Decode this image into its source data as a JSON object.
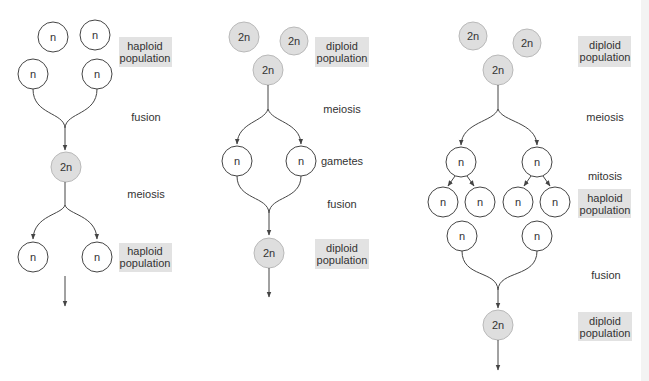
{
  "panels": [
    {
      "id": "haplontic",
      "labels": {
        "top_population": [
          "haploid",
          "population"
        ],
        "step1": "fusion",
        "step2": "meiosis",
        "bottom_population": [
          "haploid",
          "population"
        ]
      },
      "cells": {
        "top": [
          "n",
          "n",
          "n",
          "n"
        ],
        "zygote": "2n",
        "products": [
          "n",
          "n"
        ]
      }
    },
    {
      "id": "diplontic",
      "labels": {
        "top_population": [
          "diploid",
          "population"
        ],
        "step1": "meiosis",
        "step2": "gametes",
        "step3": "fusion",
        "bottom_population": [
          "diploid",
          "population"
        ]
      },
      "cells": {
        "top": [
          "2n",
          "2n",
          "2n"
        ],
        "gametes": [
          "n",
          "n"
        ],
        "zygote": "2n"
      }
    },
    {
      "id": "haplodiplontic",
      "labels": {
        "top_population": [
          "diploid",
          "population"
        ],
        "step1": "meiosis",
        "step2": "mitosis",
        "mid_population": [
          "haploid",
          "population"
        ],
        "step3": "fusion",
        "bottom_population": [
          "diploid",
          "population"
        ]
      },
      "cells": {
        "top": [
          "2n",
          "2n",
          "2n"
        ],
        "spores": [
          "n",
          "n"
        ],
        "mitotic_products": [
          "n",
          "n",
          "n",
          "n"
        ],
        "gametes": [
          "n",
          "n"
        ],
        "zygote": "2n"
      }
    }
  ],
  "colors": {
    "haploid_fill": "#ffffff",
    "diploid_fill": "#dedede",
    "label_box": "#e2e2e2",
    "line": "#444444",
    "text": "#333333"
  }
}
